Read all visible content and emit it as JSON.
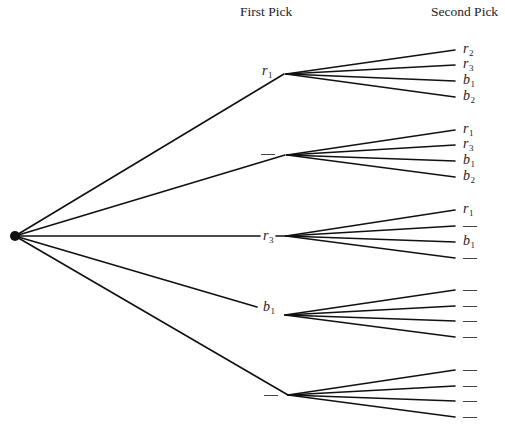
{
  "headers": {
    "first_pick": "First Pick",
    "second_pick": "Second Pick"
  },
  "root": {
    "x": 15,
    "y": 236,
    "radius": 5
  },
  "first_level": [
    {
      "label": "r",
      "sub": "1",
      "blank": false,
      "line_end": {
        "x": 284,
        "y": 74
      },
      "fan_origin": {
        "x": 286,
        "y": 74
      },
      "label_pos": {
        "x": 262,
        "y": 64
      },
      "children": [
        {
          "label": "r",
          "sub": "2",
          "blank": false,
          "y": 50
        },
        {
          "label": "r",
          "sub": "3",
          "blank": false,
          "y": 65
        },
        {
          "label": "b",
          "sub": "1",
          "blank": false,
          "y": 81
        },
        {
          "label": "b",
          "sub": "2",
          "blank": false,
          "y": 97
        }
      ]
    },
    {
      "label": "",
      "sub": "",
      "blank": true,
      "line_end": {
        "x": 285,
        "y": 155
      },
      "fan_origin": {
        "x": 287,
        "y": 155
      },
      "label_pos": {
        "x": 261,
        "y": 154
      },
      "children": [
        {
          "label": "r",
          "sub": "1",
          "blank": false,
          "y": 130
        },
        {
          "label": "r",
          "sub": "3",
          "blank": false,
          "y": 145
        },
        {
          "label": "b",
          "sub": "1",
          "blank": false,
          "y": 161
        },
        {
          "label": "b",
          "sub": "2",
          "blank": false,
          "y": 177
        }
      ]
    },
    {
      "label": "r",
      "sub": "3",
      "blank": false,
      "line_end": {
        "x": 260,
        "y": 236
      },
      "fan_origin": {
        "x": 286,
        "y": 236
      },
      "label_pos": {
        "x": 263,
        "y": 229
      },
      "tail_from": 276,
      "children": [
        {
          "label": "r",
          "sub": "1",
          "blank": false,
          "y": 210
        },
        {
          "label": "",
          "sub": "",
          "blank": true,
          "y": 226
        },
        {
          "label": "b",
          "sub": "1",
          "blank": false,
          "y": 242
        },
        {
          "label": "",
          "sub": "",
          "blank": true,
          "y": 258
        }
      ]
    },
    {
      "label": "b",
      "sub": "1",
      "blank": false,
      "line_end": {
        "x": 257,
        "y": 307
      },
      "fan_origin": {
        "x": 285,
        "y": 315
      },
      "label_pos": {
        "x": 263,
        "y": 300
      },
      "children": [
        {
          "label": "",
          "sub": "",
          "blank": true,
          "y": 290
        },
        {
          "label": "",
          "sub": "",
          "blank": true,
          "y": 306
        },
        {
          "label": "",
          "sub": "",
          "blank": true,
          "y": 321
        },
        {
          "label": "",
          "sub": "",
          "blank": true,
          "y": 337
        }
      ]
    },
    {
      "label": "",
      "sub": "",
      "blank": true,
      "line_end": {
        "x": 288,
        "y": 395
      },
      "fan_origin": {
        "x": 288,
        "y": 395
      },
      "label_pos": {
        "x": 264,
        "y": 395
      },
      "children": [
        {
          "label": "",
          "sub": "",
          "blank": true,
          "y": 370
        },
        {
          "label": "",
          "sub": "",
          "blank": true,
          "y": 386
        },
        {
          "label": "",
          "sub": "",
          "blank": true,
          "y": 401
        },
        {
          "label": "",
          "sub": "",
          "blank": true,
          "y": 417
        }
      ]
    }
  ],
  "leaf_x_end": 455,
  "leaf_label_x": 463,
  "style": {
    "line_color": "#111111",
    "line_width": 1.6
  }
}
